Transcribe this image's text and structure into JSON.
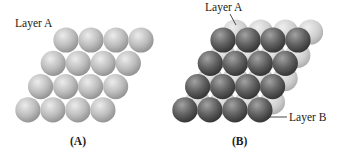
{
  "figure": {
    "panels": [
      {
        "id": "A",
        "caption": "(A)",
        "labels": [
          {
            "text": "Layer A",
            "x": 15,
            "y": 27
          }
        ],
        "layers": [
          {
            "name": "Layer A",
            "shade": "light",
            "rows": 4,
            "cols": 4,
            "origin_x": 66,
            "origin_y": 40,
            "dx": 25,
            "row_dx": -12.7,
            "row_dy": 23.3,
            "r": 12.6
          }
        ]
      },
      {
        "id": "B",
        "caption": "(B)",
        "labels": [
          {
            "text": "Layer A",
            "x": 205,
            "y": 11
          },
          {
            "text": "Layer B",
            "x": 289,
            "y": 121
          }
        ],
        "layers": [
          {
            "name": "Layer A",
            "shade": "light",
            "rows": 4,
            "cols": 4,
            "origin_x": 235.5,
            "origin_y": 32,
            "dx": 25,
            "row_dx": -12.7,
            "row_dy": 23.3,
            "r": 12.6
          },
          {
            "name": "Layer B",
            "shade": "dark",
            "rows": 4,
            "cols": 4,
            "origin_x": 223,
            "origin_y": 40,
            "dx": 25,
            "row_dx": -12.7,
            "row_dy": 23.3,
            "r": 12.6
          }
        ]
      }
    ]
  },
  "text": {
    "panel_a_layer_label": "Layer A",
    "panel_a_caption": "(A)",
    "panel_b_layer_a_label": "Layer A",
    "panel_b_layer_b_label": "Layer B",
    "panel_b_caption": "(B)"
  },
  "colors": {
    "light_sphere_highlight": "#e6e6e6",
    "light_sphere_mid": "#b9b9b9",
    "light_sphere_edge": "#8e8e8e",
    "dark_sphere_highlight": "#9a9a9a",
    "dark_sphere_mid": "#5e5e5e",
    "dark_sphere_edge": "#2e2e2e",
    "text": "#1a1a1a"
  }
}
